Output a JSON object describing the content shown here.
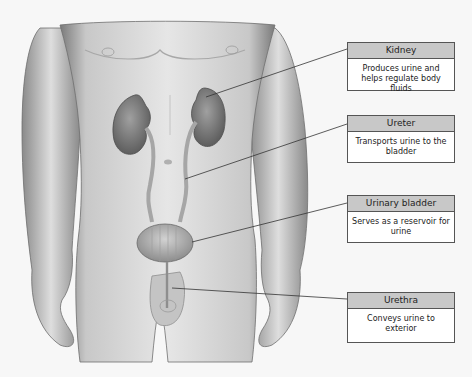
{
  "diagram": {
    "labels": [
      {
        "name": "Kidney",
        "description": "Produces urine and helps regulate body fluids",
        "box_top": 42,
        "box_height": 49,
        "leader_from": [
          210,
          97
        ],
        "leader_to": [
          347,
          49
        ]
      },
      {
        "name": "Ureter",
        "description": "Transports urine to the bladder",
        "box_top": 115,
        "box_height": 48,
        "leader_from": [
          185,
          179
        ],
        "leader_to": [
          347,
          124
        ]
      },
      {
        "name": "Urinary bladder",
        "description": "Serves as a reservoir for urine",
        "box_top": 195,
        "box_height": 48,
        "leader_from": [
          192,
          242
        ],
        "leader_to": [
          347,
          203
        ]
      },
      {
        "name": "Urethra",
        "description": "Conveys urine to exterior",
        "box_top": 292,
        "box_height": 51,
        "leader_from": [
          172,
          288
        ],
        "leader_to": [
          347,
          299
        ]
      }
    ],
    "colors": {
      "background": "#f7f7f7",
      "skin": "#d9d9d9",
      "organ": "#8a8a8a",
      "header_fill": "#c8c8c8",
      "border": "#555555",
      "leader": "#333333"
    }
  }
}
